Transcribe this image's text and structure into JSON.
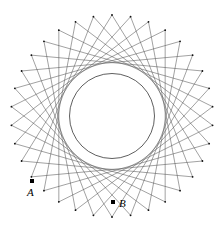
{
  "figure": {
    "type": "star-polygon",
    "canvas": {
      "width": 224,
      "height": 232,
      "background": "#ffffff"
    },
    "outer_circle": {
      "center_x": 112,
      "center_y": 116,
      "radius": 101,
      "stroke": "#3a3a3a",
      "stroke_width": 0.6,
      "visible": false
    },
    "inner_circle": {
      "center_x": 112,
      "center_y": 116,
      "radius": 42.5,
      "stroke": "#1a1a1a",
      "stroke_width": 0.7,
      "visible": true
    },
    "star": {
      "vertex_count": 34,
      "step": 11,
      "stroke": "#555555",
      "stroke_width": 0.55,
      "vertex_dot_radius": 0.9,
      "vertex_dot_fill": "#111111"
    },
    "points": [
      {
        "id": "A",
        "label": "A",
        "x": 32,
        "y": 181,
        "dot_size": 4,
        "fill": "#000000",
        "label_x": 27,
        "label_y": 187
      },
      {
        "id": "B",
        "label": "B",
        "x": 113,
        "y": 202,
        "dot_size": 4,
        "fill": "#000000",
        "label_x": 119,
        "label_y": 198
      }
    ]
  }
}
